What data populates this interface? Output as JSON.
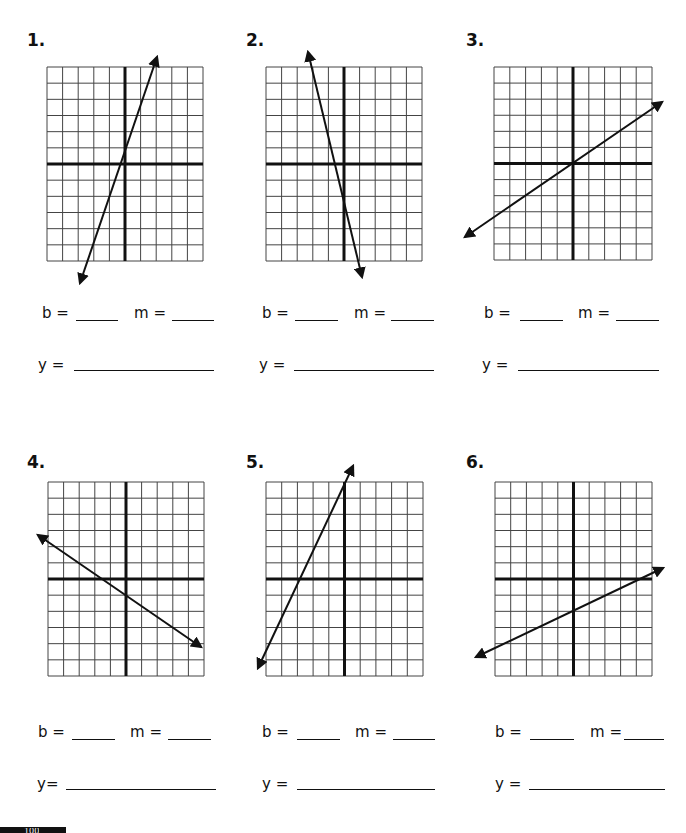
{
  "worksheet": {
    "grid": {
      "columns": 10,
      "rows": 12,
      "y_axis_col": 5,
      "x_axis_row": 6
    },
    "colors": {
      "line": "#111111",
      "grid": "#444444",
      "axis": "#111111",
      "background": "#ffffff"
    },
    "labels": {
      "b": "b =",
      "m": "m =",
      "y": "y ="
    },
    "footer": {
      "page_number": "100"
    },
    "problems": [
      {
        "number": "1.",
        "b_label": "b =",
        "m_label": "m =",
        "y_label": "y =",
        "grid_box": [
          47,
          67,
          203,
          261
        ],
        "arrow": {
          "from": [
            80,
            283
          ],
          "to": [
            157,
            57
          ]
        }
      },
      {
        "number": "2.",
        "b_label": "b =",
        "m_label": "m =",
        "y_label": "y =",
        "grid_box": [
          266,
          67,
          422,
          261
        ],
        "arrow": {
          "from": [
            308,
            52
          ],
          "to": [
            362,
            277
          ]
        }
      },
      {
        "number": "3.",
        "b_label": "b =",
        "m_label": "m =",
        "y_label": "y =",
        "grid_box": [
          494,
          67,
          652,
          260
        ],
        "arrow": {
          "from": [
            465,
            237
          ],
          "to": [
            662,
            102
          ]
        }
      },
      {
        "number": "4.",
        "b_label": "b =",
        "m_label": "m =",
        "y_label": "y=",
        "grid_box": [
          48,
          482,
          204,
          676
        ],
        "arrow": {
          "from": [
            38,
            535
          ],
          "to": [
            201,
            647
          ]
        }
      },
      {
        "number": "5.",
        "b_label": "b =",
        "m_label": "m =",
        "y_label": "y =",
        "grid_box": [
          266,
          482,
          423,
          676
        ],
        "arrow": {
          "from": [
            258,
            668
          ],
          "to": [
            353,
            466
          ]
        }
      },
      {
        "number": "6.",
        "b_label": "b =",
        "m_label": "m =",
        "y_label": "y =",
        "grid_box": [
          495,
          482,
          652,
          676
        ],
        "arrow": {
          "from": [
            476,
            657
          ],
          "to": [
            663,
            568
          ]
        }
      }
    ]
  }
}
